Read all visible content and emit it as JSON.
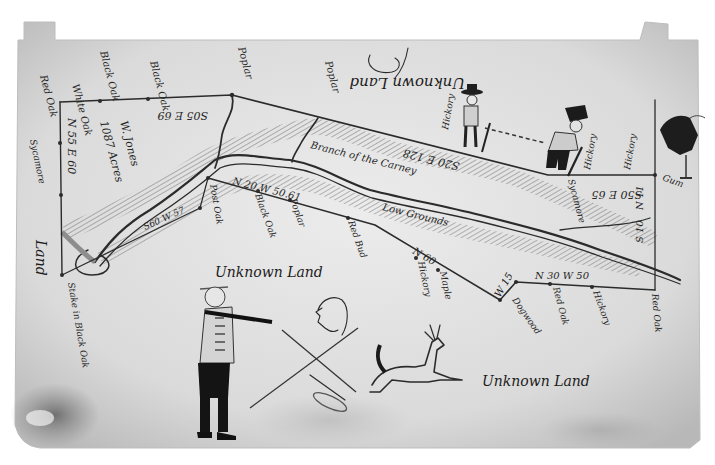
{
  "map": {
    "kind": "hand-drawn survey plat",
    "regions": {
      "unknown_land_top": "Unknown Land",
      "unknown_land_middle": "Unknown Land",
      "unknown_land_bottom": "Unknown Land",
      "left_edge_land": "Land"
    },
    "boundary_calls": {
      "top_left": "S05 E 69",
      "left_vertical": "N 55 E 60",
      "top_middle": "S20 E 128",
      "top_right": "S50 E 65",
      "lower_left_short": "S60 W 57",
      "middle_line": "N 20 W 50.61",
      "diagonal_lower": "N 60",
      "lower_right_line": "N 30 W 50",
      "short_corner": "W 15",
      "right_vertical": "S 10",
      "right_vertical_upper": "N 11"
    },
    "interior_notes": {
      "acres": "1087 Acres",
      "owner": "W. Jones",
      "branch": "Branch of the Carney",
      "low_grounds": "Low Grounds"
    },
    "tree_markers": [
      "Hickory",
      "Hickory",
      "Hickory",
      "Hickory",
      "Hickory",
      "Poplar",
      "Poplar",
      "Poplar",
      "Poplar",
      "Black Oak",
      "Black Oak",
      "White Oak",
      "Red Oak",
      "Post Oak",
      "Maple",
      "Dogwood",
      "Red Bud",
      "Sycamore",
      "Gum",
      "Ash",
      "Beech"
    ],
    "corner_notes": {
      "bottom_left_stake": "Stake in Black Oak",
      "right_corner": "Red Oak",
      "gum_corner": "Gum"
    },
    "figures": [
      "surveyor-with-hat",
      "chain-carrier",
      "hunter-with-rifle",
      "deer",
      "profile-sketch",
      "crossed-lines-x",
      "bear-like-creature"
    ],
    "colors": {
      "paper": "#dcdcdc",
      "ink": "#2b2b2b",
      "shade": "#9a9a9a",
      "background": "#ffffff"
    }
  }
}
